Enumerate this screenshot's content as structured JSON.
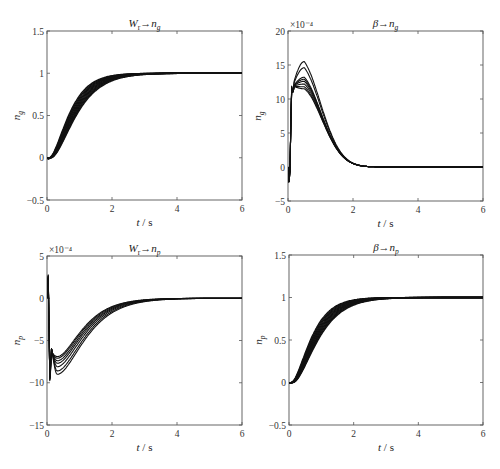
{
  "figure": {
    "caption": "",
    "background": "#ffffff",
    "line_color": "#111111"
  },
  "chart_data": [
    {
      "id": "top-left",
      "type": "line",
      "title": "W_r → n_g",
      "title_main": "W",
      "title_sub1": "r",
      "title_arrow": "→",
      "title_var": "n",
      "title_sub2": "g",
      "xlabel": "t / s",
      "ylabel": "n_g",
      "ylabel_main": "n",
      "ylabel_sub": "g",
      "xlim": [
        0,
        6
      ],
      "ylim": [
        -0.5,
        1.5
      ],
      "xticks": [
        0,
        2,
        4,
        6
      ],
      "yticks": [
        -0.5,
        0,
        0.5,
        1,
        1.5
      ],
      "ytick_labels": [
        "-0.5",
        "0",
        "0.5",
        "1",
        "1.5"
      ],
      "scale_note": "",
      "grid": false,
      "series_description": "family of ~10 step responses rising from 0 at t≈0.1 s to steady state 1 by t≈2 s",
      "steady_state": 1,
      "series": [
        {
          "name": "response",
          "x": [
            0,
            0.05,
            0.1,
            0.2,
            0.3,
            0.5,
            0.75,
            1.0,
            1.25,
            1.5,
            2.0,
            3.0,
            6.0
          ],
          "y": [
            0,
            0,
            0.02,
            0.25,
            0.45,
            0.7,
            0.86,
            0.93,
            0.97,
            0.985,
            0.998,
            1.0,
            1.0
          ]
        }
      ]
    },
    {
      "id": "top-right",
      "type": "line",
      "title": "β → n_g",
      "title_main": "β",
      "title_sub1": "",
      "title_arrow": "→",
      "title_var": "n",
      "title_sub2": "g",
      "xlabel": "t / s",
      "ylabel": "n_g",
      "ylabel_main": "n",
      "ylabel_sub": "g",
      "xlim": [
        0,
        6
      ],
      "ylim": [
        -5,
        20
      ],
      "xticks": [
        0,
        2,
        4,
        6
      ],
      "yticks": [
        -5,
        0,
        5,
        10,
        15,
        20
      ],
      "ytick_labels": [
        "-5",
        "0",
        "5",
        "10",
        "15",
        "20"
      ],
      "scale_note": "×10⁻⁴",
      "grid": false,
      "series_description": "family of ~10 responses: dip to about -2.5e-4 near t≈0.1 s, jump to ~12.5e-4, peaks between ~11.5e-4 and ~15.5e-4 at t≈0.5 s, decaying to 0 by t≈3 s",
      "peak_range": [
        11.5,
        15.5
      ],
      "peak_time": 0.5,
      "min_value": -2.5,
      "series": [
        {
          "name": "peak-15.5",
          "peak": 15.5
        },
        {
          "name": "peak-14.6",
          "peak": 14.6
        },
        {
          "name": "peak-13.2",
          "peak": 13.2
        },
        {
          "name": "peak-12.9",
          "peak": 12.9
        },
        {
          "name": "peak-12.6",
          "peak": 12.6
        },
        {
          "name": "peak-12.2",
          "peak": 12.2
        },
        {
          "name": "peak-11.8",
          "peak": 11.8
        },
        {
          "name": "peak-11.5",
          "peak": 11.5
        }
      ]
    },
    {
      "id": "bottom-left",
      "type": "line",
      "title": "W_r → n_p",
      "title_main": "W",
      "title_sub1": "r",
      "title_arrow": "→",
      "title_var": "n",
      "title_sub2": "p",
      "xlabel": "t / s",
      "ylabel": "n_p",
      "ylabel_main": "n",
      "ylabel_sub": "p",
      "xlim": [
        0,
        6
      ],
      "ylim": [
        -15,
        5
      ],
      "xticks": [
        0,
        2,
        4,
        6
      ],
      "yticks": [
        -15,
        -10,
        -5,
        0,
        5
      ],
      "ytick_labels": [
        "-15",
        "-10",
        "-5",
        "0",
        "5"
      ],
      "scale_note": "×10⁻⁴",
      "grid": false,
      "series_description": "family of ~10 responses: spike to ~+3e-4 at t≈0.05 s, drop to about -10.5e-4, troughs between ~-7e-4 and ~-9e-4 near t≈0.3 s, recovering to 0 by t≈2.5 s",
      "trough_range": [
        -9,
        -7
      ],
      "trough_time": 0.3,
      "max_value": 2.8,
      "series": [
        {
          "name": "trough-9.0",
          "trough": -9.0
        },
        {
          "name": "trough-8.6",
          "trough": -8.6
        },
        {
          "name": "trough-8.1",
          "trough": -8.1
        },
        {
          "name": "trough-7.7",
          "trough": -7.7
        },
        {
          "name": "trough-7.4",
          "trough": -7.4
        },
        {
          "name": "trough-7.1",
          "trough": -7.1
        },
        {
          "name": "trough-6.9",
          "trough": -6.9
        }
      ]
    },
    {
      "id": "bottom-right",
      "type": "line",
      "title": "β → n_p",
      "title_main": "β",
      "title_sub1": "",
      "title_arrow": "→",
      "title_var": "n",
      "title_sub2": "p",
      "xlabel": "t / s",
      "ylabel": "n_p",
      "ylabel_main": "n",
      "ylabel_sub": "p",
      "xlim": [
        0,
        6
      ],
      "ylim": [
        -0.5,
        1.5
      ],
      "xticks": [
        0,
        2,
        4,
        6
      ],
      "yticks": [
        -0.5,
        0,
        0.5,
        1,
        1.5
      ],
      "ytick_labels": [
        "-0.5",
        "0",
        "0.5",
        "1",
        "1.5"
      ],
      "scale_note": "",
      "grid": false,
      "series_description": "family of ~10 step responses rising from 0 at t≈0.1 s to steady state 1 by t≈2 s",
      "steady_state": 1,
      "series": [
        {
          "name": "response",
          "x": [
            0,
            0.05,
            0.1,
            0.2,
            0.3,
            0.5,
            0.75,
            1.0,
            1.25,
            1.5,
            2.0,
            3.0,
            6.0
          ],
          "y": [
            0,
            0,
            0.02,
            0.25,
            0.45,
            0.7,
            0.86,
            0.93,
            0.97,
            0.985,
            0.998,
            1.0,
            1.0
          ]
        }
      ]
    }
  ]
}
